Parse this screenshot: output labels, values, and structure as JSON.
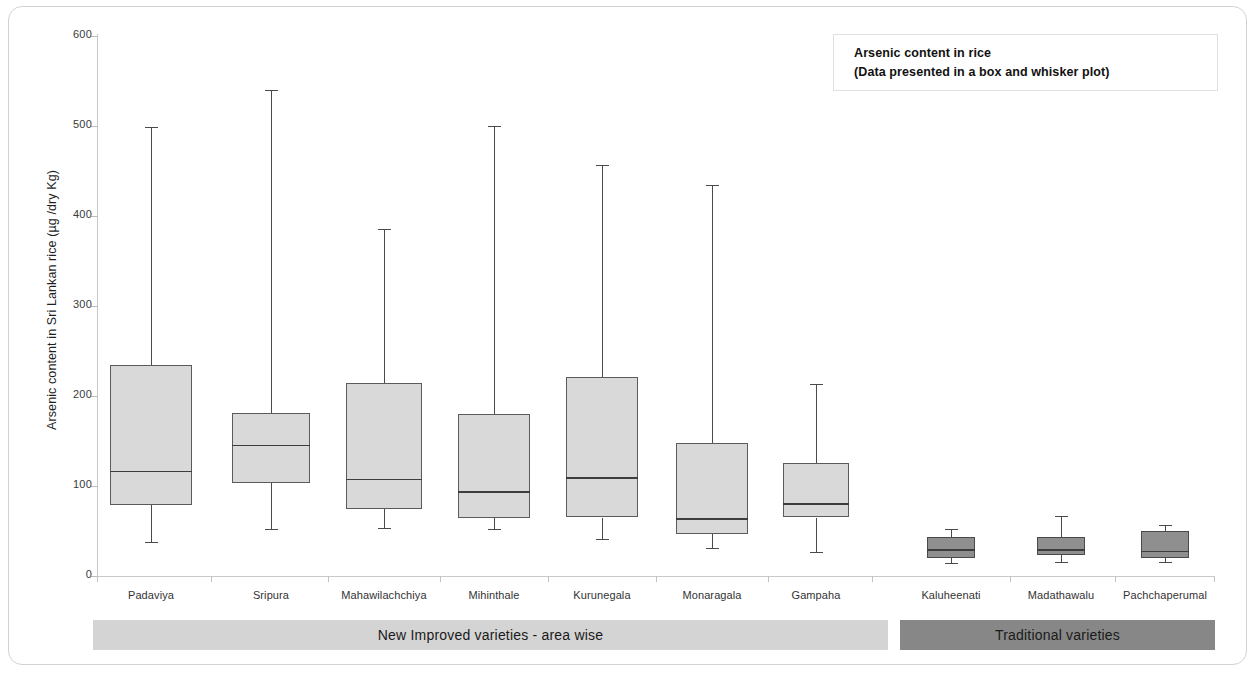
{
  "figure": {
    "background": "#ffffff",
    "frame_color": "#d2d2d2"
  },
  "legend": {
    "line1": "Arsenic content in rice",
    "line2": "(Data presented in a box and whisker plot)"
  },
  "axes": {
    "y_title": "Arsenic content in Sri Lankan rice (µg /dry Kg)",
    "y_ticks": [
      "600",
      "500",
      "400",
      "300",
      "200",
      "100",
      "0"
    ]
  },
  "groups": [
    {
      "label": "New Improved varieties - area wise",
      "shade": "light",
      "color": "#d4d4d4",
      "start": 0,
      "end": 6
    },
    {
      "label": "Traditional varieties",
      "shade": "dark",
      "color": "#878787",
      "start": 7,
      "end": 9
    }
  ],
  "chart_data": {
    "type": "box",
    "title": "Arsenic content in rice",
    "subtitle": "(Data presented in a box and whisker plot)",
    "xlabel": "",
    "ylabel": "Arsenic content in Sri Lankan rice (µg /dry Kg)",
    "ylim": [
      0,
      600
    ],
    "ytick_step": 100,
    "grid": false,
    "legend_position": "top-right",
    "categories": [
      "Padaviya",
      "Sripura",
      "Mahawilachchiya",
      "Mihinthale",
      "Kurunegala",
      "Monaragala",
      "Gampaha",
      "Kaluheenati",
      "Madathawalu",
      "Pachchaperumal"
    ],
    "group_of_category": [
      "New Improved varieties - area wise",
      "New Improved varieties - area wise",
      "New Improved varieties - area wise",
      "New Improved varieties - area wise",
      "New Improved varieties - area wise",
      "New Improved varieties - area wise",
      "New Improved varieties - area wise",
      "Traditional varieties",
      "Traditional varieties",
      "Traditional varieties"
    ],
    "boxes": [
      {
        "category": "Padaviya",
        "whisker_low": 38,
        "q1": 79,
        "median": 117,
        "q3": 234,
        "whisker_high": 499,
        "shade": "light"
      },
      {
        "category": "Sripura",
        "whisker_low": 52,
        "q1": 103,
        "median": 146,
        "q3": 181,
        "whisker_high": 540,
        "shade": "light"
      },
      {
        "category": "Mahawilachchiya",
        "whisker_low": 53,
        "q1": 74,
        "median": 108,
        "q3": 214,
        "whisker_high": 386,
        "shade": "light"
      },
      {
        "category": "Mihinthale",
        "whisker_low": 52,
        "q1": 64,
        "median": 94,
        "q3": 180,
        "whisker_high": 500,
        "shade": "light"
      },
      {
        "category": "Kurunegala",
        "whisker_low": 41,
        "q1": 65,
        "median": 110,
        "q3": 221,
        "whisker_high": 457,
        "shade": "light"
      },
      {
        "category": "Monaragala",
        "whisker_low": 31,
        "q1": 47,
        "median": 64,
        "q3": 148,
        "whisker_high": 435,
        "shade": "light"
      },
      {
        "category": "Gampaha",
        "whisker_low": 27,
        "q1": 65,
        "median": 81,
        "q3": 126,
        "whisker_high": 213,
        "shade": "light"
      },
      {
        "category": "Kaluheenati",
        "whisker_low": 15,
        "q1": 20,
        "median": 30,
        "q3": 43,
        "whisker_high": 52,
        "shade": "dark"
      },
      {
        "category": "Madathawalu",
        "whisker_low": 16,
        "q1": 23,
        "median": 30,
        "q3": 43,
        "whisker_high": 67,
        "shade": "dark"
      },
      {
        "category": "Pachchaperumal",
        "whisker_low": 16,
        "q1": 20,
        "median": 28,
        "q3": 50,
        "whisker_high": 57,
        "shade": "dark"
      }
    ]
  }
}
